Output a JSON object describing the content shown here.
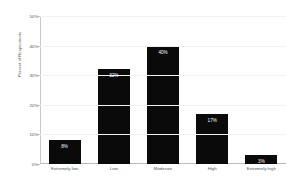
{
  "chart_data": {
    "type": "bar",
    "title": "",
    "subtitle": "",
    "xlabel": "",
    "ylabel": "Percent of Respondents",
    "categories": [
      "Extremely low",
      "Low",
      "Moderate",
      "High",
      "Extremely high"
    ],
    "values": [
      8,
      32,
      40,
      17,
      3
    ],
    "value_labels": [
      "8%",
      "32%",
      "40%",
      "17%",
      "3%"
    ],
    "ylim": [
      0,
      50
    ],
    "ytick_values": [
      0,
      10,
      20,
      30,
      40,
      50
    ],
    "ytick_labels": [
      "0%",
      "10%",
      "20%",
      "30%",
      "40%",
      "50%"
    ],
    "grid": true,
    "legend": false,
    "legend_position": "none",
    "bar_color": "#0a0a0a",
    "value_label_color": "#ffffff",
    "axis_color": "#c0c0c0",
    "grid_color": "#f2f2f2",
    "background_color": "#ffffff"
  }
}
